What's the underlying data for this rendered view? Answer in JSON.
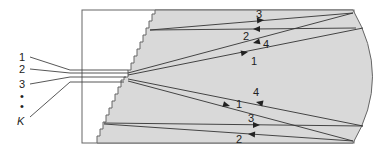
{
  "diagram": {
    "type": "optical-beam-path-schematic",
    "input_labels": [
      "1",
      "2",
      "3",
      "•",
      "•",
      "K"
    ],
    "upper_ray_labels": {
      "ray3": "3",
      "ray2": "2",
      "ray4": "4",
      "ray1": "1"
    },
    "lower_ray_labels": {
      "ray4": "4",
      "ray1": "1",
      "ray3": "3",
      "ray2": "2"
    },
    "colors": {
      "fill": "#d9d9d9",
      "stroke": "#555555",
      "ray": "#333333",
      "background": "#ffffff"
    }
  }
}
